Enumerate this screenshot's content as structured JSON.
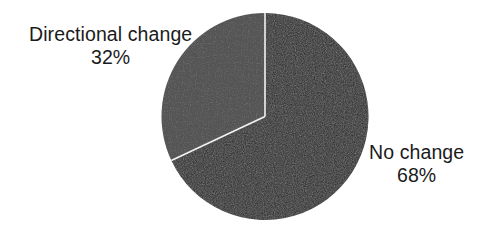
{
  "chart_data": {
    "type": "pie",
    "title": "",
    "subtitle": "",
    "xlabel": "",
    "ylabel": "",
    "legend_position": "none",
    "grid": false,
    "labels_inline": true,
    "unit": "%",
    "total": 100,
    "categories": [
      "No change",
      "Directional change"
    ],
    "values": [
      68,
      32
    ],
    "slices": [
      {
        "label": "No change",
        "value": 68,
        "value_text": "68%",
        "color": "#1a1a1a",
        "start_angle_deg": 0,
        "end_angle_deg": 244.8,
        "label_position": "right"
      },
      {
        "label": "Directional change",
        "value": 32,
        "value_text": "32%",
        "color": "#555555",
        "start_angle_deg": 244.8,
        "end_angle_deg": 360,
        "label_position": "upper-left"
      }
    ],
    "geometry": {
      "center_x": 265,
      "center_y": 116.5,
      "radius": 103.5,
      "start_at_twelve_oclock": true,
      "direction": "clockwise"
    },
    "annotations": [
      {
        "name": "directional-change-label",
        "text": "Directional change",
        "value_text": "32%"
      },
      {
        "name": "no-change-label",
        "text": "No change",
        "value_text": "68%"
      }
    ]
  },
  "colors": {
    "background": "#ffffff",
    "text": "#1b1b1b",
    "slice_no_change": "#1a1a1a",
    "slice_directional_change": "#555555",
    "divider": "#f2f2f2"
  }
}
